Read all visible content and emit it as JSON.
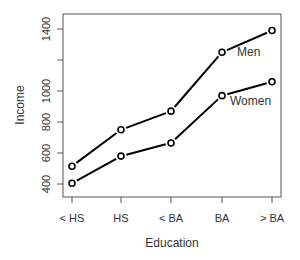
{
  "chart_data": {
    "type": "line",
    "title": "",
    "xlabel": "Education",
    "ylabel": "Income",
    "categories": [
      "< HS",
      "HS",
      "< BA",
      "BA",
      "> BA"
    ],
    "series": [
      {
        "name": "Men",
        "values": [
          515,
          750,
          870,
          1250,
          1390
        ]
      },
      {
        "name": "Women",
        "values": [
          405,
          580,
          665,
          970,
          1060
        ]
      }
    ],
    "yticks": [
      400,
      600,
      800,
      1000,
      1200,
      1400
    ],
    "ytick_labels": [
      "400",
      "600",
      "800",
      "1000",
      "",
      "1400"
    ],
    "ylim": [
      330,
      1480
    ],
    "grid": false,
    "legend": "inline labels near line ends",
    "markers": "open circles",
    "line_color": "#000000"
  }
}
